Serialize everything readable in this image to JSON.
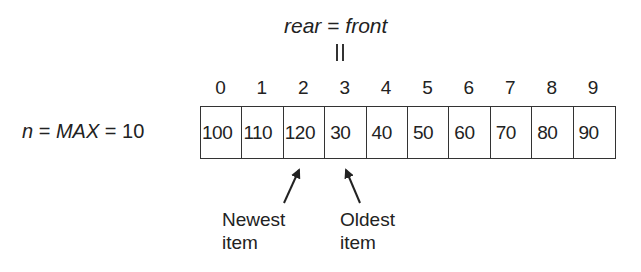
{
  "diagram": {
    "pointer_label": {
      "left": "rear",
      "operator": "=",
      "right": "front"
    },
    "equality_marker": "||",
    "size_label": {
      "n": "n",
      "eq1": "=",
      "max": "MAX",
      "eq2": "=",
      "value": "10"
    },
    "indices": [
      "0",
      "1",
      "2",
      "3",
      "4",
      "5",
      "6",
      "7",
      "8",
      "9"
    ],
    "cells": [
      "100",
      "110",
      "120",
      "30",
      "40",
      "50",
      "60",
      "70",
      "80",
      "90"
    ],
    "pointer_index": 3,
    "annotations": [
      {
        "line1": "Newest",
        "line2": "item",
        "points_to_index": 2
      },
      {
        "line1": "Oldest",
        "line2": "item",
        "points_to_index": 3
      }
    ],
    "line_color": "#333333"
  }
}
